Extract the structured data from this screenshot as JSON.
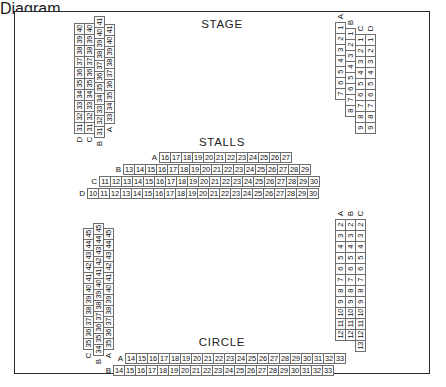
{
  "plan": {
    "captions": {
      "stage": "STAGE",
      "stalls": "STALLS",
      "circle": "CIRCLE"
    }
  },
  "seating": {
    "stalls": {
      "left_block": {
        "columns": [
          {
            "label": "D",
            "seats": [
              31,
              32,
              33,
              34,
              35,
              36,
              37,
              38,
              39,
              40
            ]
          },
          {
            "label": "C",
            "seats": [
              31,
              32,
              33,
              34,
              35,
              36,
              37,
              38,
              39,
              40
            ]
          },
          {
            "label": "B",
            "seats": [
              31,
              32,
              33,
              34,
              35,
              36,
              37,
              38,
              39,
              40,
              41
            ]
          },
          {
            "label": "A",
            "seats": [
              33,
              34,
              35,
              36,
              37,
              38,
              39,
              40,
              41
            ]
          }
        ]
      },
      "centre_rows": [
        {
          "label": "A",
          "seats": [
            16,
            17,
            18,
            19,
            20,
            21,
            22,
            23,
            24,
            25,
            26,
            27
          ]
        },
        {
          "label": "B",
          "seats": [
            13,
            14,
            15,
            16,
            17,
            18,
            19,
            20,
            21,
            22,
            23,
            24,
            25,
            26,
            27,
            28,
            29
          ]
        },
        {
          "label": "C",
          "seats": [
            11,
            12,
            13,
            14,
            15,
            16,
            17,
            18,
            19,
            20,
            21,
            22,
            23,
            24,
            25,
            26,
            27,
            28,
            29,
            30
          ]
        },
        {
          "label": "D",
          "seats": [
            10,
            11,
            12,
            13,
            14,
            15,
            16,
            17,
            18,
            19,
            20,
            21,
            22,
            23,
            24,
            25,
            26,
            27,
            28,
            29,
            30
          ]
        }
      ],
      "right_block": {
        "columns": [
          {
            "label": "A",
            "seats": [
              1,
              2,
              3,
              4,
              5,
              6,
              7
            ]
          },
          {
            "label": "B",
            "seats": [
              1,
              2,
              3,
              4,
              5,
              6,
              7,
              8
            ]
          },
          {
            "label": "C",
            "seats": [
              1,
              2,
              3,
              4,
              5,
              6,
              7,
              8,
              9
            ]
          },
          {
            "label": "D",
            "seats": [
              1,
              2,
              3,
              4,
              5,
              6,
              7,
              8,
              9
            ]
          }
        ]
      }
    },
    "circle": {
      "left_block": {
        "columns": [
          {
            "label": "C",
            "seats": [
              35,
              36,
              37,
              38,
              39,
              40,
              41,
              42,
              43,
              44,
              45
            ]
          },
          {
            "label": "B",
            "seats": [
              34,
              35,
              36,
              37,
              38,
              39,
              40,
              41,
              42,
              43,
              44,
              45
            ]
          },
          {
            "label": "A",
            "seats": [
              35,
              36,
              37,
              38,
              39,
              40,
              41,
              42,
              43,
              44,
              45
            ]
          }
        ]
      },
      "centre_rows": [
        {
          "label": "A",
          "seats": [
            14,
            15,
            16,
            17,
            18,
            19,
            20,
            21,
            22,
            23,
            24,
            25,
            26,
            27,
            28,
            29,
            30,
            31,
            32,
            33
          ]
        },
        {
          "label": "B",
          "seats": [
            14,
            15,
            16,
            17,
            18,
            19,
            20,
            21,
            22,
            23,
            24,
            25,
            26,
            27,
            28,
            29,
            30,
            31,
            32,
            33
          ]
        }
      ],
      "right_block": {
        "columns": [
          {
            "label": "A",
            "seats": [
              2,
              3,
              4,
              5,
              6,
              7,
              8,
              9,
              10,
              11,
              12
            ]
          },
          {
            "label": "B",
            "seats": [
              2,
              3,
              4,
              5,
              6,
              7,
              8,
              9,
              10,
              11,
              12
            ]
          },
          {
            "label": "C",
            "seats": [
              2,
              3,
              4,
              5,
              6,
              7,
              8,
              9,
              10,
              11,
              12,
              13
            ]
          }
        ]
      }
    }
  }
}
